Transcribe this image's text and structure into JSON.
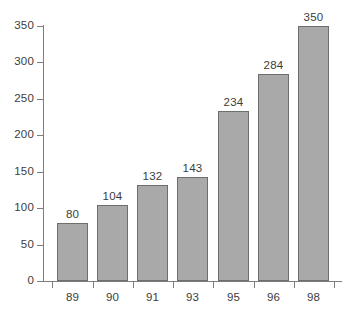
{
  "chart_data": {
    "type": "bar",
    "title": "",
    "subtitle": "",
    "xlabel": "",
    "ylabel": "",
    "categories": [
      "89",
      "90",
      "91",
      "93",
      "95",
      "96",
      "98"
    ],
    "values": [
      80,
      104,
      132,
      143,
      234,
      284,
      350
    ],
    "value_labels": [
      "80",
      "104",
      "132",
      "143",
      "234",
      "284",
      "350"
    ],
    "ylim": [
      0,
      350
    ],
    "ytick_step": 50,
    "ytick_labels": [
      "0",
      "50",
      "100",
      "150",
      "200",
      "250",
      "300",
      "350"
    ],
    "ytick_values": [
      0,
      50,
      100,
      150,
      200,
      250,
      300,
      350
    ],
    "grid": false,
    "legend": null,
    "orientation": "vertical",
    "colors": {
      "bar_fill": "#a9a9a9",
      "bar_border": "#6e6e6e",
      "axis": "#7d7d7d",
      "text": "#3c3c3c",
      "background": "#ffffff"
    }
  }
}
